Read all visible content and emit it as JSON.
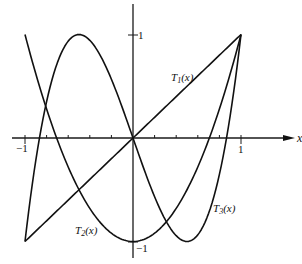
{
  "chart_data": {
    "type": "line",
    "title": "",
    "xlabel": "x",
    "ylabel": "",
    "xlim": [
      -1,
      1
    ],
    "ylim": [
      -1,
      1
    ],
    "grid": false,
    "x_tick_step": 0.2,
    "x_tick_labels": [
      "-1",
      "1"
    ],
    "y_tick_labels": [
      "1",
      "-1"
    ],
    "series": [
      {
        "name": "T1(x)",
        "formula": "x",
        "x": [
          -1,
          -0.5,
          0,
          0.5,
          1
        ],
        "values": [
          -1,
          -0.5,
          0,
          0.5,
          1
        ]
      },
      {
        "name": "T2(x)",
        "formula": "2x^2 - 1",
        "x": [
          -1,
          -0.75,
          -0.5,
          -0.25,
          0,
          0.25,
          0.5,
          0.75,
          1
        ],
        "values": [
          1,
          0.125,
          -0.5,
          -0.875,
          -1,
          -0.875,
          -0.5,
          0.125,
          1
        ]
      },
      {
        "name": "T3(x)",
        "formula": "4x^3 - 3x",
        "x": [
          -1,
          -0.75,
          -0.5,
          -0.25,
          0,
          0.25,
          0.5,
          0.75,
          1
        ],
        "values": [
          -1,
          0.5625,
          1,
          0.6875,
          0,
          -0.6875,
          -1,
          -0.5625,
          1
        ]
      }
    ],
    "annotations": [
      {
        "text": "T1(x)",
        "near": "T1 line, upper right"
      },
      {
        "text": "T2(x)",
        "near": "T2 curve, lower left"
      },
      {
        "text": "T3(x)",
        "near": "T3 curve, lower right"
      }
    ]
  },
  "labels": {
    "x_axis": "x",
    "x_neg1": "−1",
    "x_pos1": "1",
    "y_pos1": "1",
    "y_neg1": "−1",
    "t1_base": "T",
    "t1_sub": "1",
    "t1_arg": "(x)",
    "t2_base": "T",
    "t2_sub": "2",
    "t2_arg": "(x)",
    "t3_base": "T",
    "t3_sub": "3",
    "t3_arg": "(x)"
  }
}
